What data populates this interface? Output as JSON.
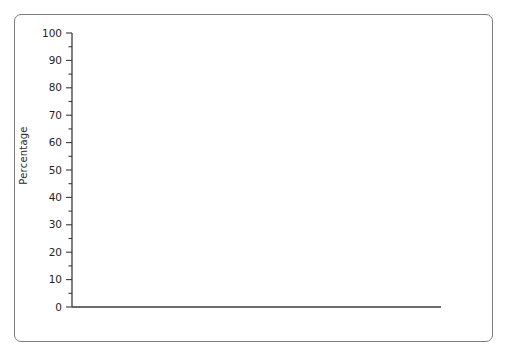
{
  "axis": {
    "ylabel": "Percentage",
    "yticks": [
      0,
      10,
      20,
      30,
      40,
      50,
      60,
      70,
      80,
      90,
      100
    ],
    "xticks": [
      1980,
      1985,
      1990,
      1995,
      2000
    ],
    "xlabel": ""
  },
  "legend": {
    "items": [
      {
        "label": "Alcohol",
        "color": "#4a4a4a"
      },
      {
        "label": "Cigarettes",
        "color": "#575757"
      },
      {
        "label": "Marijuana/Hashish",
        "color": "#808080"
      },
      {
        "label": "Cocaine",
        "color": "#b3b3b3"
      }
    ]
  },
  "end_labels": [
    {
      "name": "alcohol",
      "text": "49.8%"
    },
    {
      "name": "cigarettes",
      "text": "29.5%"
    },
    {
      "name": "marijuana",
      "text": "22.4%"
    },
    {
      "name": "cocaine",
      "text": "2.1%"
    }
  ],
  "chart_data": {
    "type": "line",
    "title": "",
    "xlabel": "",
    "ylabel": "Percentage",
    "xlim": [
      1979,
      2001.5
    ],
    "ylim": [
      0,
      100
    ],
    "grid": false,
    "legend_position": "top-right",
    "x": [
      1980,
      1981,
      1982,
      1983,
      1984,
      1985,
      1986,
      1987,
      1988,
      1989,
      1990,
      1991,
      1992,
      1993,
      1994,
      1995,
      1996,
      1997,
      1998,
      1999,
      2000,
      2001
    ],
    "series": [
      {
        "name": "Alcohol",
        "color": "#4a4a4a",
        "end_label": "49.8%",
        "values": [
          72.5,
          71.5,
          70.0,
          69.0,
          67.5,
          66.0,
          65.0,
          66.5,
          63.5,
          60.0,
          57.0,
          54.0,
          48.6,
          51.0,
          50.1,
          51.3,
          50.8,
          52.7,
          52.0,
          51.0,
          50.0,
          49.8
        ]
      },
      {
        "name": "Cigarettes",
        "color": "#575757",
        "end_label": "29.5%",
        "values": [
          30.5,
          30.0,
          30.0,
          30.3,
          29.3,
          30.1,
          29.6,
          29.4,
          28.7,
          28.6,
          29.4,
          28.3,
          27.8,
          29.9,
          31.2,
          33.5,
          34.0,
          36.5,
          35.1,
          34.6,
          31.4,
          29.5
        ]
      },
      {
        "name": "Marijuana/Hashish",
        "color": "#808080",
        "end_label": "22.4%",
        "values": [
          33.7,
          31.6,
          28.5,
          27.0,
          25.2,
          25.7,
          23.4,
          21.0,
          18.0,
          16.7,
          14.0,
          13.8,
          11.9,
          15.5,
          19.0,
          21.2,
          21.9,
          23.7,
          22.8,
          23.1,
          21.6,
          22.4
        ]
      },
      {
        "name": "Cocaine",
        "color": "#b3b3b3",
        "end_label": "2.1%",
        "values": [
          5.2,
          5.8,
          5.0,
          4.9,
          5.8,
          6.7,
          6.2,
          4.3,
          3.4,
          2.8,
          1.9,
          1.4,
          1.3,
          1.3,
          1.5,
          1.8,
          2.0,
          2.3,
          2.4,
          2.6,
          2.1,
          2.1
        ]
      }
    ]
  }
}
